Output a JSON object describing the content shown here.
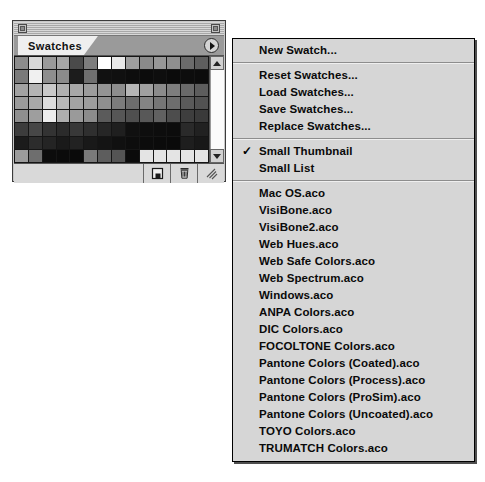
{
  "palette": {
    "title": "Swatches",
    "tab_label": "Swatches",
    "close_box_name": "close-box",
    "collapse_box_name": "collapse-box",
    "menu_button_icon": "right-triangle-icon",
    "scroll_up_icon": "scroll-up-arrow-icon",
    "scroll_down_icon": "scroll-down-arrow-icon",
    "footer_buttons": [
      {
        "name": "new-swatch-icon",
        "glyph": "❐"
      },
      {
        "name": "trash-icon",
        "glyph": "🗑"
      },
      {
        "name": "resize-grip-icon",
        "glyph": "╱╱"
      }
    ],
    "swatch_colors": [
      "#8c8c8c",
      "#d8d8d8",
      "#9a9a9a",
      "#a6a6a6",
      "#4a4a4a",
      "#7d7d7d",
      "#ffffff",
      "#e8e8e8",
      "#9e9e9e",
      "#8a8a8a",
      "#979797",
      "#8f8f8f",
      "#6b6b6b",
      "#5e5e5e",
      "#7a7a7a",
      "#f0f0f0",
      "#8e8e8e",
      "#8b8b8b",
      "#1c1c1c",
      "#6f6f6f",
      "#111111",
      "#101010",
      "#0d0d0d",
      "#0c0c0c",
      "#0e0e0e",
      "#0b0b0b",
      "#0d0d0d",
      "#0c0c0c",
      "#a2a2a2",
      "#b4b4b4",
      "#c9c9c9",
      "#b0b0b0",
      "#a8a8a8",
      "#9c9c9c",
      "#949494",
      "#8d8d8d",
      "#b6b6b6",
      "#a0a0a0",
      "#8b8b8b",
      "#7e7e7e",
      "#6a6a6a",
      "#5d5d5d",
      "#9b9b9b",
      "#a9a9a9",
      "#dcdcdc",
      "#b8b8b8",
      "#a3a3a3",
      "#9d9d9d",
      "#8f8f8f",
      "#7c7c7c",
      "#6d6d6d",
      "#848484",
      "#767676",
      "#6e6e6e",
      "#5a5a5a",
      "#525252",
      "#8f8f8f",
      "#9e9e9e",
      "#ededed",
      "#aeaeae",
      "#9a9a9a",
      "#8c8c8c",
      "#5b5b5b",
      "#565656",
      "#4f4f4f",
      "#585858",
      "#616161",
      "#4d4d4d",
      "#3e3e3e",
      "#3a3a3a",
      "#3c3c3c",
      "#474747",
      "#333333",
      "#2b2b2b",
      "#383838",
      "#2f2f2f",
      "#262626",
      "#1f1f1f",
      "#101010",
      "#0e0e0e",
      "#0d0d0d",
      "#0c0c0c",
      "#2a2a2a",
      "#212121",
      "#1b1b1b",
      "#2c2c2c",
      "#242424",
      "#1a1a1a",
      "#222222",
      "#191919",
      "#141414",
      "#101010",
      "#0d0d0d",
      "#0c0c0c",
      "#0b0b0b",
      "#0a0a0a",
      "#1e1e1e",
      "#181818",
      "#9c9c9c",
      "#6e6e6e",
      "#0c0c0c",
      "#0b0b0b",
      "#0a0a0a",
      "#7a7a7a",
      "#5d5d5d",
      "#545454",
      "#0b0b0b",
      "#e4e4e4",
      "#e4e4e4",
      "#e4e4e4",
      "#e4e4e4",
      "#e4e4e4"
    ]
  },
  "menu": {
    "groups": [
      {
        "items": [
          {
            "label": "New Swatch...",
            "checked": false
          }
        ]
      },
      {
        "items": [
          {
            "label": "Reset Swatches...",
            "checked": false
          },
          {
            "label": "Load Swatches...",
            "checked": false
          },
          {
            "label": "Save Swatches...",
            "checked": false
          },
          {
            "label": "Replace Swatches...",
            "checked": false
          }
        ]
      },
      {
        "items": [
          {
            "label": "Small Thumbnail",
            "checked": true
          },
          {
            "label": "Small List",
            "checked": false
          }
        ]
      },
      {
        "items": [
          {
            "label": "Mac OS.aco",
            "checked": false
          },
          {
            "label": "VisiBone.aco",
            "checked": false
          },
          {
            "label": "VisiBone2.aco",
            "checked": false
          },
          {
            "label": "Web Hues.aco",
            "checked": false
          },
          {
            "label": "Web Safe Colors.aco",
            "checked": false
          },
          {
            "label": "Web Spectrum.aco",
            "checked": false
          },
          {
            "label": "Windows.aco",
            "checked": false
          },
          {
            "label": "ANPA Colors.aco",
            "checked": false
          },
          {
            "label": "DIC Colors.aco",
            "checked": false
          },
          {
            "label": "FOCOLTONE Colors.aco",
            "checked": false
          },
          {
            "label": "Pantone Colors (Coated).aco",
            "checked": false
          },
          {
            "label": "Pantone Colors (Process).aco",
            "checked": false
          },
          {
            "label": "Pantone Colors (ProSim).aco",
            "checked": false
          },
          {
            "label": "Pantone Colors (Uncoated).aco",
            "checked": false
          },
          {
            "label": "TOYO Colors.aco",
            "checked": false
          },
          {
            "label": "TRUMATCH Colors.aco",
            "checked": false
          }
        ]
      }
    ],
    "check_glyph": "✓"
  },
  "colors": {
    "menu_bg": "#d6d6d6",
    "palette_bg": "#c8c8c8",
    "tab_active_bg": "#efefef",
    "text": "#0a0a0a"
  }
}
